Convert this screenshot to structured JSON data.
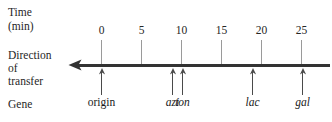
{
  "figure": {
    "background": "#ffffff",
    "axis_color": "#333333",
    "tick_color": "#9a9a9a",
    "text_color": "#262626"
  },
  "row_labels": {
    "time": "Time",
    "time_unit": "(min)",
    "direction": "Direction",
    "of": "of",
    "transfer": "transfer",
    "gene": "Gene"
  },
  "axis": {
    "direction_icon": "left-arrowhead-icon",
    "min_label": "0",
    "max_label": "25"
  },
  "chart_data": {
    "type": "timeline",
    "title": "",
    "xlabel": "Time (min)",
    "ylabel": "",
    "xlim": [
      0,
      25
    ],
    "grid": false,
    "legend": "none",
    "direction": "right-to-left",
    "ticks": [
      {
        "value": 0,
        "label": "0",
        "x": 101
      },
      {
        "value": 5,
        "label": "5",
        "x": 141
      },
      {
        "value": 10,
        "label": "10",
        "x": 181
      },
      {
        "value": 15,
        "label": "15",
        "x": 221
      },
      {
        "value": 20,
        "label": "20",
        "x": 261
      },
      {
        "value": 25,
        "label": "25",
        "x": 301
      }
    ],
    "markers": [
      {
        "label": "origin",
        "italic": false,
        "time": 0.0,
        "x": 101
      },
      {
        "label": "azi",
        "italic": true,
        "time": 8.9,
        "x": 172
      },
      {
        "label": "ton",
        "italic": true,
        "time": 10.0,
        "x": 182
      },
      {
        "label": "lac",
        "italic": true,
        "time": 18.9,
        "x": 252
      },
      {
        "label": "gal",
        "italic": true,
        "time": 25.1,
        "x": 302
      }
    ]
  }
}
